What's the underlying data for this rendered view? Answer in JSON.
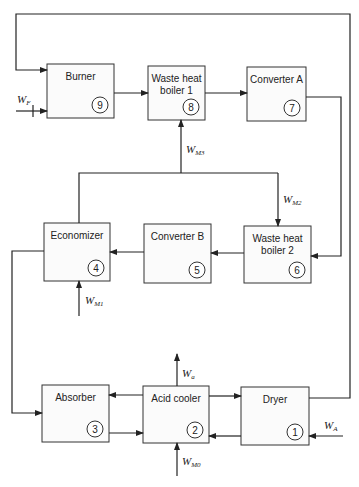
{
  "units": [
    {
      "id": "burner",
      "label_lines": [
        "Burner"
      ],
      "number": "9",
      "x": 47,
      "y": 64,
      "w": 67,
      "h": 54
    },
    {
      "id": "waste-heat-boiler-1",
      "label_lines": [
        "Waste heat",
        "boiler 1"
      ],
      "number": "8",
      "x": 148,
      "y": 66,
      "w": 57,
      "h": 54
    },
    {
      "id": "converter-a",
      "label_lines": [
        "Converter A"
      ],
      "number": "7",
      "x": 247,
      "y": 67,
      "w": 59,
      "h": 54
    },
    {
      "id": "economizer",
      "label_lines": [
        "Economizer"
      ],
      "number": "4",
      "x": 44,
      "y": 223,
      "w": 66,
      "h": 58
    },
    {
      "id": "converter-b",
      "label_lines": [
        "Converter B"
      ],
      "number": "5",
      "x": 144,
      "y": 224,
      "w": 67,
      "h": 59
    },
    {
      "id": "waste-heat-boiler-2",
      "label_lines": [
        "Waste heat",
        "boiler 2"
      ],
      "number": "6",
      "x": 244,
      "y": 226,
      "w": 67,
      "h": 57
    },
    {
      "id": "absorber",
      "label_lines": [
        "Absorber"
      ],
      "number": "3",
      "x": 42,
      "y": 385,
      "w": 67,
      "h": 57
    },
    {
      "id": "acid-cooler",
      "label_lines": [
        "Acid cooler"
      ],
      "number": "2",
      "x": 143,
      "y": 386,
      "w": 66,
      "h": 57
    },
    {
      "id": "dryer",
      "label_lines": [
        "Dryer"
      ],
      "number": "1",
      "x": 241,
      "y": 387,
      "w": 68,
      "h": 58
    }
  ],
  "streams": {
    "WF": {
      "main": "W",
      "sub": "F"
    },
    "WM3": {
      "main": "W",
      "sub": "M3"
    },
    "WM2": {
      "main": "W",
      "sub": "M2"
    },
    "WM1": {
      "main": "W",
      "sub": "M1"
    },
    "Wa": {
      "main": "W",
      "sub": "a"
    },
    "WM0": {
      "main": "W",
      "sub": "M0"
    },
    "WA": {
      "main": "W",
      "sub": "A"
    }
  }
}
